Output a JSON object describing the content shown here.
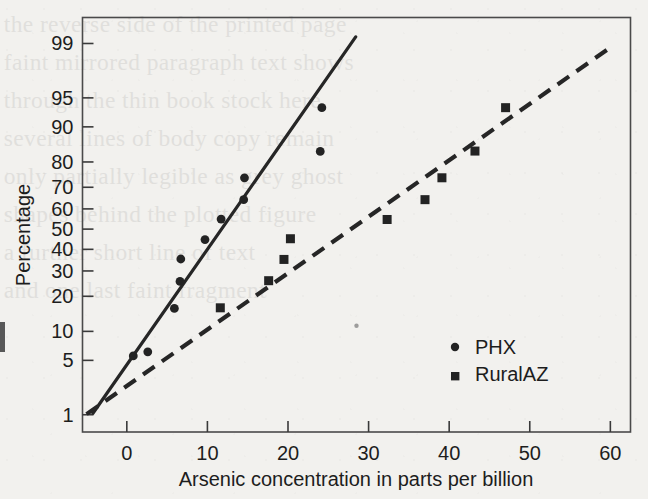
{
  "figure": {
    "background_color": "#f2f1ee",
    "ink_color": "#232323",
    "scan_artifact_note": "scanned book page with faint reverse-side show-through"
  },
  "chart_data": {
    "type": "scatter",
    "title": "",
    "subtitle": "",
    "xlabel": "Arsenic concentration in parts per billion",
    "ylabel": "Percentage",
    "plot_kind": "normal-probability-plot",
    "grid": false,
    "legend_position": "inside-right-lower",
    "xlim": [
      -5.5,
      62.5
    ],
    "ylim_percent": [
      0.55,
      99.6
    ],
    "xticks": [
      0,
      10,
      20,
      30,
      40,
      50,
      60
    ],
    "xtick_labels": [
      "0",
      "10",
      "20",
      "30",
      "40",
      "50",
      "60"
    ],
    "yticks_percent": [
      1,
      5,
      10,
      20,
      30,
      40,
      50,
      60,
      70,
      80,
      90,
      95,
      99
    ],
    "ytick_labels": [
      "1",
      "5",
      "10",
      "20",
      "30",
      "40",
      "50",
      "60",
      "70",
      "80",
      "90",
      "95",
      "99"
    ],
    "series": [
      {
        "name": "PHX",
        "marker": "circle",
        "marker_color": "#232323",
        "points": [
          {
            "x": 0.8,
            "y": 5.6
          },
          {
            "x": 2.6,
            "y": 6.2
          },
          {
            "x": 5.9,
            "y": 16.0
          },
          {
            "x": 6.6,
            "y": 25.6
          },
          {
            "x": 6.7,
            "y": 35.4
          },
          {
            "x": 9.7,
            "y": 44.8
          },
          {
            "x": 11.7,
            "y": 55.0
          },
          {
            "x": 14.5,
            "y": 64.4
          },
          {
            "x": 14.6,
            "y": 74.0
          },
          {
            "x": 24.0,
            "y": 83.5
          },
          {
            "x": 24.2,
            "y": 93.6
          }
        ],
        "fit_line": {
          "style": "solid",
          "x_start": -4.2,
          "y_start_percent": 1.05,
          "x_end": 28.4,
          "y_end_percent": 99.2
        }
      },
      {
        "name": "RuralAZ",
        "marker": "square",
        "marker_color": "#232323",
        "points": [
          {
            "x": 11.6,
            "y": 16.2
          },
          {
            "x": 17.6,
            "y": 25.9
          },
          {
            "x": 19.5,
            "y": 35.2
          },
          {
            "x": 20.3,
            "y": 45.2
          },
          {
            "x": 32.3,
            "y": 54.8
          },
          {
            "x": 37.0,
            "y": 64.4
          },
          {
            "x": 39.1,
            "y": 74.0
          },
          {
            "x": 43.2,
            "y": 83.6
          },
          {
            "x": 47.0,
            "y": 93.6
          }
        ],
        "fit_line": {
          "style": "dashed",
          "x_start": -5.0,
          "y_start_percent": 1.02,
          "x_end": 60.2,
          "y_end_percent": 98.9
        }
      }
    ],
    "stray_marks": [
      {
        "x": 28.5,
        "y_percent": 11.3,
        "note": "small speck near (28.5, 11%)"
      }
    ]
  },
  "legend": {
    "entries": [
      {
        "label": "PHX",
        "marker": "circle"
      },
      {
        "label": "RuralAZ",
        "marker": "square"
      }
    ]
  },
  "bleed_through_lines": [
    "the reverse side of the printed page",
    "faint mirrored paragraph text shows",
    "through the thin book stock here",
    "",
    "several lines of body copy remain",
    "only partially legible as grey ghost",
    "shapes behind the plotted figure",
    "",
    "a further short line of text",
    "",
    "and one last faint fragment"
  ]
}
